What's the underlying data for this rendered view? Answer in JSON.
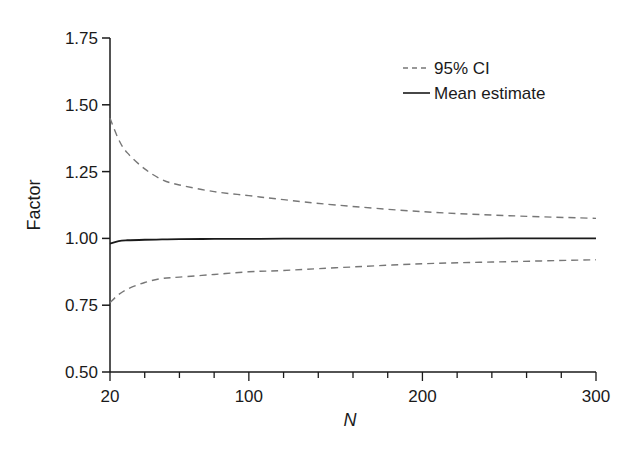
{
  "chart_data": {
    "type": "line",
    "title": "",
    "xlabel": "N",
    "ylabel": "Factor",
    "xlim": [
      20,
      300
    ],
    "ylim": [
      0.5,
      1.75
    ],
    "x_ticks": [
      20,
      100,
      200,
      300
    ],
    "x_tick_labels": [
      "20",
      "100",
      "200",
      "300"
    ],
    "x_minor_tick_step": 20,
    "y_ticks": [
      0.5,
      0.75,
      1.0,
      1.25,
      1.5,
      1.75
    ],
    "y_tick_labels": [
      "0.50",
      "0.75",
      "1.00",
      "1.25",
      "1.50",
      "1.75"
    ],
    "grid": false,
    "legend_position": "upper right",
    "x": [
      20,
      25,
      30,
      40,
      50,
      60,
      80,
      100,
      120,
      150,
      200,
      250,
      300
    ],
    "series": [
      {
        "name": "95% CI (upper)",
        "legend_label": "95% CI",
        "style": "dashed",
        "color": "#777777",
        "values": [
          1.45,
          1.37,
          1.32,
          1.26,
          1.22,
          1.2,
          1.175,
          1.16,
          1.145,
          1.125,
          1.1,
          1.085,
          1.075
        ]
      },
      {
        "name": "Mean estimate",
        "legend_label": "Mean estimate",
        "style": "solid",
        "color": "#1a1a1a",
        "values": [
          0.98,
          0.99,
          0.993,
          0.995,
          0.996,
          0.997,
          0.998,
          0.998,
          0.999,
          0.999,
          0.999,
          1.0,
          1.0
        ]
      },
      {
        "name": "95% CI (lower)",
        "legend_label": "",
        "style": "dashed",
        "color": "#777777",
        "values": [
          0.76,
          0.79,
          0.81,
          0.835,
          0.85,
          0.855,
          0.865,
          0.875,
          0.88,
          0.89,
          0.905,
          0.913,
          0.92
        ]
      }
    ]
  },
  "legend": {
    "items": [
      {
        "label": "95% CI",
        "style": "dashed"
      },
      {
        "label": "Mean estimate",
        "style": "solid"
      }
    ]
  }
}
